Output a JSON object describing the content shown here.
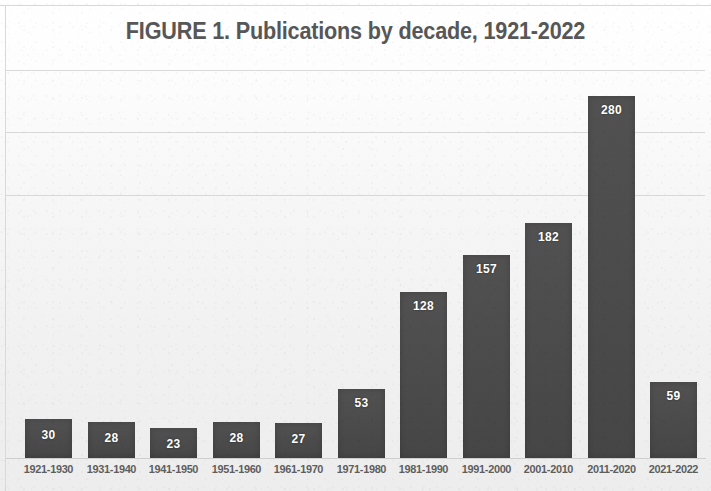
{
  "figure": {
    "title": "FIGURE 1. Publications by decade, 1921-2022",
    "bar_color": "#4a4a4a",
    "label_color": "#5e5e5e",
    "title_color": "#575757",
    "background_color": "#f2f2f2",
    "gridline_color": "#d2d2d2"
  },
  "chart_data": {
    "type": "bar",
    "title": "FIGURE 1. Publications by decade, 1921-2022",
    "xlabel": "",
    "ylabel": "",
    "categories": [
      "1921-1930",
      "1931-1940",
      "1941-1950",
      "1951-1960",
      "1961-1970",
      "1971-1980",
      "1981-1990",
      "1991-2000",
      "2001-2010",
      "2011-2020",
      "2021-2022"
    ],
    "values": [
      30,
      28,
      23,
      28,
      27,
      53,
      128,
      157,
      182,
      280,
      59
    ],
    "data_labels": [
      "30",
      "28",
      "23",
      "28",
      "27",
      "53",
      "128",
      "157",
      "182",
      "280",
      "59"
    ],
    "ylim": [
      0,
      300
    ],
    "grid": true,
    "gridlines_y": [
      100,
      200,
      300
    ],
    "legend": null,
    "axis_tick_labels_y": [],
    "series": [
      {
        "name": "Publications",
        "values": [
          30,
          28,
          23,
          28,
          27,
          53,
          128,
          157,
          182,
          280,
          59
        ]
      }
    ]
  }
}
